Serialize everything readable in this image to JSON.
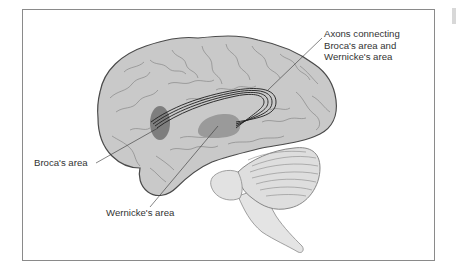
{
  "figure": {
    "colors": {
      "brain_fill": "#c9c9c9",
      "brain_outline": "#555555",
      "broca_fill": "#7a7a7a",
      "wernicke_fill": "#9a9a9a",
      "cerebellum_fill": "#dedede",
      "brainstem_fill": "#e4e4e4",
      "axon_stroke": "#222222",
      "frame_border": "#8a8a8a"
    },
    "labels": {
      "axons": {
        "line1": "Axons connecting",
        "line2": "Broca's area and",
        "line3": "Wernicke's area"
      },
      "broca": "Broca's area",
      "wernicke": "Wernicke's area"
    }
  }
}
